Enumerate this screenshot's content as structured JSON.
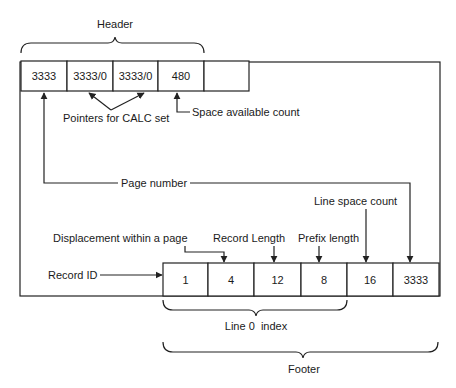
{
  "header": {
    "label": "Header",
    "cells": [
      "3333",
      "3333/0",
      "3333/0",
      "480",
      ""
    ]
  },
  "annotations": {
    "pointers_calc": "Pointers for CALC set",
    "space_available": "Space available count",
    "page_number": "Page number",
    "line_space_count": "Line space count",
    "displacement": "Displacement within a page",
    "record_length": "Record Length",
    "prefix_length": "Prefix length",
    "record_id": "Record ID"
  },
  "footer": {
    "label": "Footer",
    "cells": [
      "1",
      "4",
      "12",
      "8",
      "16",
      "3333"
    ],
    "line0_index_label": "Line 0  index"
  }
}
